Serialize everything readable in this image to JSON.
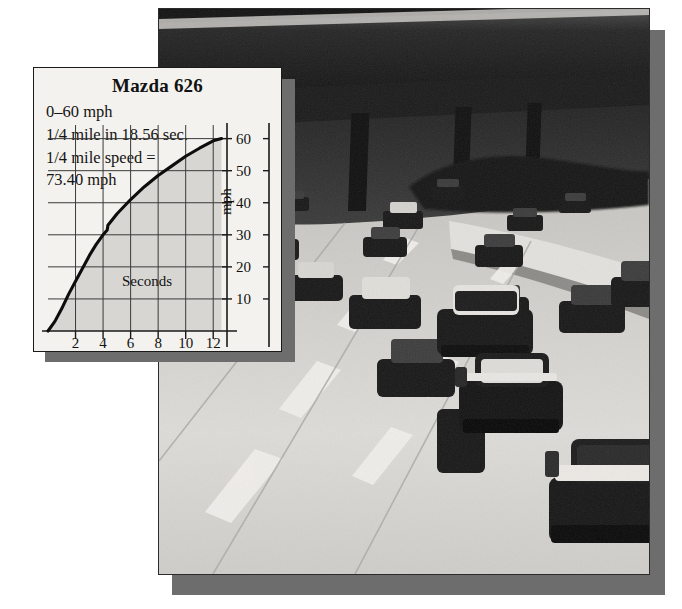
{
  "scene": {
    "description": "black-and-white photograph of a multi-lane freeway with cars, overpass bridge across the top",
    "photo_name": "freeway-traffic-photo"
  },
  "inset": {
    "title": "Mazda 626",
    "spec_lines": [
      "0–60 mph",
      "1/4 mile in 18.56 sec.",
      "1/4 mile speed =",
      "73.40 mph"
    ]
  },
  "chart_data": {
    "type": "line",
    "title": "Mazda 626",
    "xlabel": "Seconds",
    "ylabel": "mph",
    "xlim": [
      0,
      13
    ],
    "ylim": [
      0,
      63
    ],
    "xticks": [
      2,
      4,
      6,
      8,
      10,
      12
    ],
    "yticks": [
      10,
      20,
      30,
      40,
      50,
      60
    ],
    "grid": true,
    "legend": "none",
    "fill_under_curve": true,
    "series": [
      {
        "name": "acceleration",
        "x": [
          0.0,
          0.5,
          1.0,
          1.5,
          2.0,
          2.5,
          3.0,
          3.5,
          4.0,
          4.3,
          4.35,
          5.0,
          6.0,
          7.0,
          8.0,
          9.0,
          10.0,
          11.0,
          12.0,
          12.6
        ],
        "y": [
          0.0,
          3.0,
          7.0,
          11.5,
          15.5,
          19.5,
          23.5,
          27.0,
          30.0,
          31.5,
          33.0,
          36.5,
          41.0,
          45.0,
          48.5,
          51.5,
          54.5,
          57.0,
          59.3,
          60.0
        ]
      }
    ],
    "annotations": [
      "gear shift notch at about 4.3 seconds / 31 mph"
    ]
  },
  "colors": {
    "card_background": "#f4f2ee",
    "plot_fill": "#d8d6d2",
    "ink": "#121212",
    "shadow": "#6d6d6d"
  }
}
